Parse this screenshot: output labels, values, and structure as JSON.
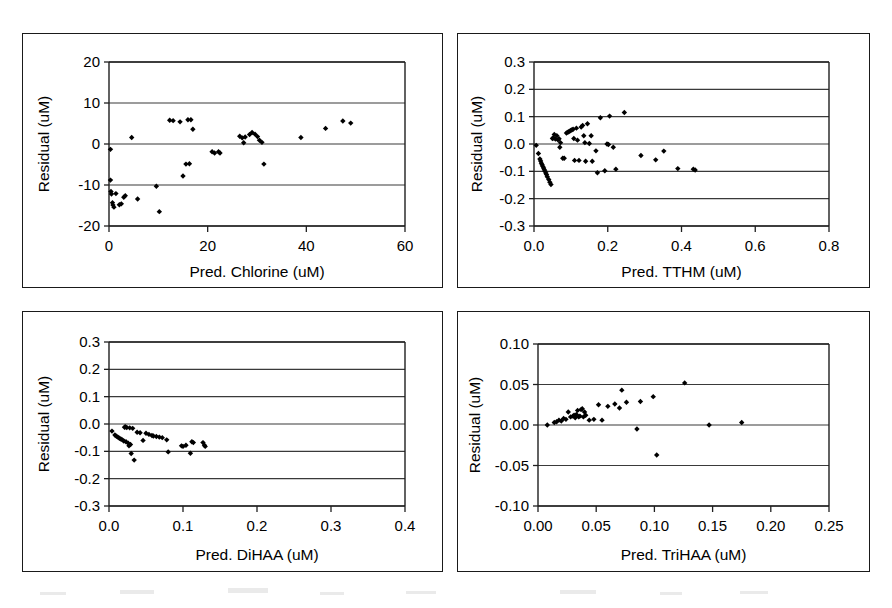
{
  "figure": {
    "title": "",
    "panel_count": 4,
    "background_color": "#ffffff",
    "marker_color": "#000000",
    "axis_color": "#1f1f1f",
    "grid_color": "#3a3a3a"
  },
  "chart_data": [
    {
      "id": "chlorine",
      "position": "top-left",
      "type": "scatter",
      "title": "",
      "xlabel": "Pred. Chlorine (uM)",
      "ylabel": "Residual (uM)",
      "xlim": [
        0,
        60
      ],
      "ylim": [
        -20,
        20
      ],
      "xticks": [
        0,
        20,
        40,
        60
      ],
      "xtick_labels": [
        "0",
        "20",
        "40",
        "60"
      ],
      "yticks": [
        -20,
        -10,
        0,
        10,
        20
      ],
      "ytick_labels": [
        "-20",
        "-10",
        "0",
        "10",
        "20"
      ],
      "grid": true,
      "grid_axis": "y",
      "legend": "none",
      "points": [
        [
          0.3,
          -1.3
        ],
        [
          0.3,
          -8.8
        ],
        [
          0.4,
          -11.6
        ],
        [
          0.5,
          -12.2
        ],
        [
          0.7,
          -14.3
        ],
        [
          0.8,
          -14.9
        ],
        [
          1.0,
          -15.4
        ],
        [
          1.4,
          -12.1
        ],
        [
          2.1,
          -14.8
        ],
        [
          2.5,
          -14.6
        ],
        [
          3.0,
          -13.0
        ],
        [
          3.3,
          -12.6
        ],
        [
          4.6,
          1.6
        ],
        [
          5.8,
          -13.4
        ],
        [
          9.6,
          -10.3
        ],
        [
          10.2,
          -16.5
        ],
        [
          12.3,
          5.8
        ],
        [
          13.0,
          5.7
        ],
        [
          14.4,
          5.4
        ],
        [
          15.0,
          -7.8
        ],
        [
          15.6,
          -4.9
        ],
        [
          16.0,
          5.9
        ],
        [
          16.3,
          -4.8
        ],
        [
          16.6,
          5.9
        ],
        [
          17.0,
          3.6
        ],
        [
          20.9,
          -1.9
        ],
        [
          21.4,
          -2.2
        ],
        [
          22.2,
          -1.9
        ],
        [
          22.5,
          -2.2
        ],
        [
          26.5,
          1.9
        ],
        [
          27.0,
          1.5
        ],
        [
          27.3,
          0.3
        ],
        [
          27.6,
          1.7
        ],
        [
          28.5,
          2.3
        ],
        [
          29.0,
          2.8
        ],
        [
          29.6,
          2.4
        ],
        [
          30.1,
          1.8
        ],
        [
          30.5,
          0.9
        ],
        [
          31.0,
          0.4
        ],
        [
          31.4,
          -4.9
        ],
        [
          38.9,
          1.6
        ],
        [
          43.9,
          3.8
        ],
        [
          47.4,
          5.6
        ],
        [
          49.0,
          5.1
        ]
      ]
    },
    {
      "id": "tthm",
      "position": "top-right",
      "type": "scatter",
      "title": "",
      "xlabel": "Pred. TTHM (uM)",
      "ylabel": "Residual (uM)",
      "xlim": [
        0.0,
        0.8
      ],
      "ylim": [
        -0.3,
        0.3
      ],
      "xticks": [
        0.0,
        0.2,
        0.4,
        0.6,
        0.8
      ],
      "xtick_labels": [
        "0.0",
        "0.2",
        "0.4",
        "0.6",
        "0.8"
      ],
      "yticks": [
        -0.3,
        -0.2,
        -0.1,
        0.0,
        0.1,
        0.2,
        0.3
      ],
      "ytick_labels": [
        "-0.3",
        "-0.2",
        "-0.1",
        "0.0",
        "0.1",
        "0.2",
        "0.3"
      ],
      "grid": true,
      "grid_axis": "y",
      "legend": "none",
      "points": [
        [
          0.006,
          -0.005
        ],
        [
          0.012,
          -0.035
        ],
        [
          0.016,
          -0.055
        ],
        [
          0.018,
          -0.062
        ],
        [
          0.02,
          -0.07
        ],
        [
          0.022,
          -0.076
        ],
        [
          0.024,
          -0.082
        ],
        [
          0.026,
          -0.088
        ],
        [
          0.028,
          -0.094
        ],
        [
          0.03,
          -0.1
        ],
        [
          0.032,
          -0.106
        ],
        [
          0.034,
          -0.112
        ],
        [
          0.036,
          -0.12
        ],
        [
          0.04,
          -0.13
        ],
        [
          0.043,
          -0.14
        ],
        [
          0.046,
          -0.148
        ],
        [
          0.05,
          0.02
        ],
        [
          0.052,
          0.022
        ],
        [
          0.055,
          0.035
        ],
        [
          0.058,
          0.018
        ],
        [
          0.062,
          0.03
        ],
        [
          0.065,
          0.015
        ],
        [
          0.068,
          0.019
        ],
        [
          0.07,
          -0.012
        ],
        [
          0.072,
          0.005
        ],
        [
          0.078,
          -0.052
        ],
        [
          0.082,
          -0.052
        ],
        [
          0.088,
          0.04
        ],
        [
          0.092,
          0.043
        ],
        [
          0.095,
          0.046
        ],
        [
          0.098,
          0.048
        ],
        [
          0.1,
          0.05
        ],
        [
          0.103,
          0.052
        ],
        [
          0.106,
          0.054
        ],
        [
          0.108,
          0.02
        ],
        [
          0.11,
          -0.06
        ],
        [
          0.115,
          0.058
        ],
        [
          0.118,
          0.014
        ],
        [
          0.122,
          -0.06
        ],
        [
          0.128,
          0.062
        ],
        [
          0.132,
          0.068
        ],
        [
          0.135,
          0.03
        ],
        [
          0.138,
          0.005
        ],
        [
          0.14,
          -0.063
        ],
        [
          0.145,
          0.074
        ],
        [
          0.15,
          0.002
        ],
        [
          0.155,
          0.03
        ],
        [
          0.158,
          -0.063
        ],
        [
          0.168,
          -0.025
        ],
        [
          0.172,
          -0.105
        ],
        [
          0.18,
          0.096
        ],
        [
          0.192,
          -0.098
        ],
        [
          0.198,
          0.0
        ],
        [
          0.202,
          -0.002
        ],
        [
          0.205,
          0.102
        ],
        [
          0.215,
          -0.012
        ],
        [
          0.222,
          -0.092
        ],
        [
          0.245,
          0.115
        ],
        [
          0.29,
          -0.042
        ],
        [
          0.33,
          -0.058
        ],
        [
          0.352,
          -0.026
        ],
        [
          0.39,
          -0.09
        ],
        [
          0.432,
          -0.092
        ],
        [
          0.437,
          -0.095
        ]
      ]
    },
    {
      "id": "dihaa",
      "position": "bottom-left",
      "type": "scatter",
      "title": "",
      "xlabel": "Pred. DiHAA (uM)",
      "ylabel": "Residual (uM)",
      "xlim": [
        0.0,
        0.4
      ],
      "ylim": [
        -0.3,
        0.3
      ],
      "xticks": [
        0.0,
        0.1,
        0.2,
        0.3,
        0.4
      ],
      "xtick_labels": [
        "0.0",
        "0.1",
        "0.2",
        "0.3",
        "0.4"
      ],
      "yticks": [
        -0.3,
        -0.2,
        -0.1,
        0.0,
        0.1,
        0.2,
        0.3
      ],
      "ytick_labels": [
        "-0.3",
        "-0.2",
        "-0.1",
        "0.0",
        "0.1",
        "0.2",
        "0.3"
      ],
      "grid": true,
      "grid_axis": "y",
      "legend": "none",
      "points": [
        [
          0.004,
          -0.026
        ],
        [
          0.008,
          -0.04
        ],
        [
          0.01,
          -0.045
        ],
        [
          0.012,
          -0.048
        ],
        [
          0.014,
          -0.052
        ],
        [
          0.016,
          -0.055
        ],
        [
          0.018,
          -0.058
        ],
        [
          0.02,
          -0.062
        ],
        [
          0.021,
          -0.012
        ],
        [
          0.022,
          -0.01
        ],
        [
          0.023,
          -0.065
        ],
        [
          0.024,
          -0.013
        ],
        [
          0.026,
          -0.07
        ],
        [
          0.027,
          -0.08
        ],
        [
          0.028,
          -0.014
        ],
        [
          0.029,
          -0.075
        ],
        [
          0.03,
          -0.108
        ],
        [
          0.032,
          -0.016
        ],
        [
          0.034,
          -0.132
        ],
        [
          0.038,
          -0.03
        ],
        [
          0.042,
          -0.032
        ],
        [
          0.046,
          -0.06
        ],
        [
          0.05,
          -0.034
        ],
        [
          0.054,
          -0.038
        ],
        [
          0.058,
          -0.042
        ],
        [
          0.06,
          -0.044
        ],
        [
          0.064,
          -0.046
        ],
        [
          0.068,
          -0.048
        ],
        [
          0.072,
          -0.05
        ],
        [
          0.078,
          -0.058
        ],
        [
          0.08,
          -0.102
        ],
        [
          0.098,
          -0.08
        ],
        [
          0.1,
          -0.082
        ],
        [
          0.104,
          -0.078
        ],
        [
          0.11,
          -0.107
        ],
        [
          0.112,
          -0.065
        ],
        [
          0.114,
          -0.068
        ],
        [
          0.127,
          -0.068
        ],
        [
          0.129,
          -0.078
        ],
        [
          0.13,
          -0.082
        ]
      ]
    },
    {
      "id": "trihaa",
      "position": "bottom-right",
      "type": "scatter",
      "title": "",
      "xlabel": "Pred. TriHAA (uM)",
      "ylabel": "Residual (uM)",
      "xlim": [
        0.0,
        0.25
      ],
      "ylim": [
        -0.1,
        0.1
      ],
      "xticks": [
        0.0,
        0.05,
        0.1,
        0.15,
        0.2,
        0.25
      ],
      "xtick_labels": [
        "0.00",
        "0.05",
        "0.10",
        "0.15",
        "0.20",
        "0.25"
      ],
      "yticks": [
        -0.1,
        -0.05,
        0.0,
        0.05,
        0.1
      ],
      "ytick_labels": [
        "-0.10",
        "-0.05",
        "0.00",
        "0.05",
        "0.10"
      ],
      "grid": true,
      "grid_axis": "y",
      "legend": "none",
      "points": [
        [
          0.008,
          0.0
        ],
        [
          0.014,
          0.003
        ],
        [
          0.016,
          0.004
        ],
        [
          0.018,
          0.006
        ],
        [
          0.02,
          0.005
        ],
        [
          0.022,
          0.008
        ],
        [
          0.024,
          0.007
        ],
        [
          0.026,
          0.016
        ],
        [
          0.028,
          0.01
        ],
        [
          0.03,
          0.011
        ],
        [
          0.031,
          0.012
        ],
        [
          0.032,
          0.009
        ],
        [
          0.033,
          0.013
        ],
        [
          0.034,
          0.018
        ],
        [
          0.035,
          0.01
        ],
        [
          0.036,
          0.011
        ],
        [
          0.037,
          0.019
        ],
        [
          0.038,
          0.02
        ],
        [
          0.039,
          0.01
        ],
        [
          0.04,
          0.016
        ],
        [
          0.041,
          0.012
        ],
        [
          0.044,
          0.006
        ],
        [
          0.048,
          0.007
        ],
        [
          0.052,
          0.025
        ],
        [
          0.055,
          0.006
        ],
        [
          0.06,
          0.023
        ],
        [
          0.066,
          0.026
        ],
        [
          0.07,
          0.021
        ],
        [
          0.072,
          0.043
        ],
        [
          0.076,
          0.028
        ],
        [
          0.085,
          -0.005
        ],
        [
          0.088,
          0.029
        ],
        [
          0.099,
          0.035
        ],
        [
          0.102,
          -0.037
        ],
        [
          0.126,
          0.052
        ],
        [
          0.147,
          0.0
        ],
        [
          0.175,
          0.003
        ]
      ]
    }
  ]
}
